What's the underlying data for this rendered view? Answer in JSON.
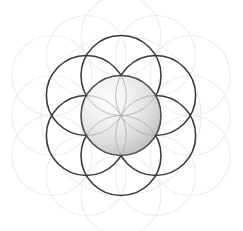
{
  "figure": {
    "subtitle": "Seed of Life sacred geometry diagram",
    "canvas": {
      "width": 243,
      "height": 231,
      "background": "#ffffff"
    }
  },
  "geometry": {
    "center": {
      "x": 121,
      "y": 115.5
    },
    "radius": 40,
    "ring_count": 6,
    "hex_angle_step_deg": 60,
    "hex_angle_offset_deg": -90,
    "faint_ring_vertex_distance": 80,
    "faint_ring_edge_distance": 69.28
  },
  "colors": {
    "stroke_dark": "#3a3a3a",
    "stroke_faint": "#ededed",
    "petal_stroke": "#a8a8a8",
    "sphere_light": "#fbfbfb",
    "sphere_mid": "#e2e2e2",
    "sphere_dark": "#bdbdbd",
    "sphere_edge": "#4a4a4a",
    "background": "#ffffff"
  },
  "strokes": {
    "dark_width": 1.6,
    "faint_width": 1.1,
    "petal_width": 0.8,
    "sphere_edge_width": 1.6
  },
  "gradient": {
    "type": "radial",
    "highlight_x_pct": 34,
    "highlight_y_pct": 30,
    "stops": [
      {
        "offset": "0%",
        "color": "#fdfdfd"
      },
      {
        "offset": "38%",
        "color": "#f0f0f0"
      },
      {
        "offset": "70%",
        "color": "#dcdcdc"
      },
      {
        "offset": "100%",
        "color": "#bcbcbc"
      }
    ]
  },
  "layers": [
    {
      "name": "faint-outer-circles",
      "count": 12,
      "opacity": 1,
      "stroke": "#ededed"
    },
    {
      "name": "dark-petal-circles",
      "count": 6,
      "opacity": 1,
      "stroke": "#3a3a3a"
    },
    {
      "name": "central-sphere",
      "count": 1,
      "opacity": 1,
      "stroke": "#4a4a4a"
    },
    {
      "name": "inner-petal-arcs",
      "count": 6,
      "opacity": 1,
      "stroke": "#a8a8a8"
    }
  ],
  "chart_data": {
    "type": "scatter",
    "xlabel": "",
    "ylabel": "",
    "xlim": [
      0,
      243
    ],
    "ylim": [
      0,
      231
    ],
    "grid": false,
    "legend": "none",
    "series": [
      {
        "name": "central-sphere",
        "marker": "circle-filled",
        "radius": 40,
        "stroke": "#4a4a4a",
        "x": [
          121
        ],
        "y": [
          115.5
        ]
      },
      {
        "name": "dark-ring-circles",
        "marker": "circle-outline",
        "radius": 40,
        "stroke": "#3a3a3a",
        "x": [
          121,
          155.64,
          155.64,
          121,
          86.36,
          86.36
        ],
        "y": [
          75.5,
          95.5,
          135.5,
          155.5,
          135.5,
          95.5
        ]
      },
      {
        "name": "faint-outer-vertex-circles",
        "marker": "circle-outline",
        "radius": 40,
        "stroke": "#ededed",
        "x": [
          121,
          190.28,
          190.28,
          121,
          51.72,
          51.72
        ],
        "y": [
          35.5,
          75.5,
          155.5,
          195.5,
          155.5,
          75.5
        ]
      },
      {
        "name": "faint-outer-edge-circles",
        "marker": "circle-outline",
        "radius": 40,
        "stroke": "#ededed",
        "x": [
          155.64,
          190.28,
          155.64,
          86.36,
          51.72,
          86.36
        ],
        "y": [
          55.5,
          115.5,
          175.5,
          175.5,
          115.5,
          55.5
        ]
      }
    ]
  }
}
